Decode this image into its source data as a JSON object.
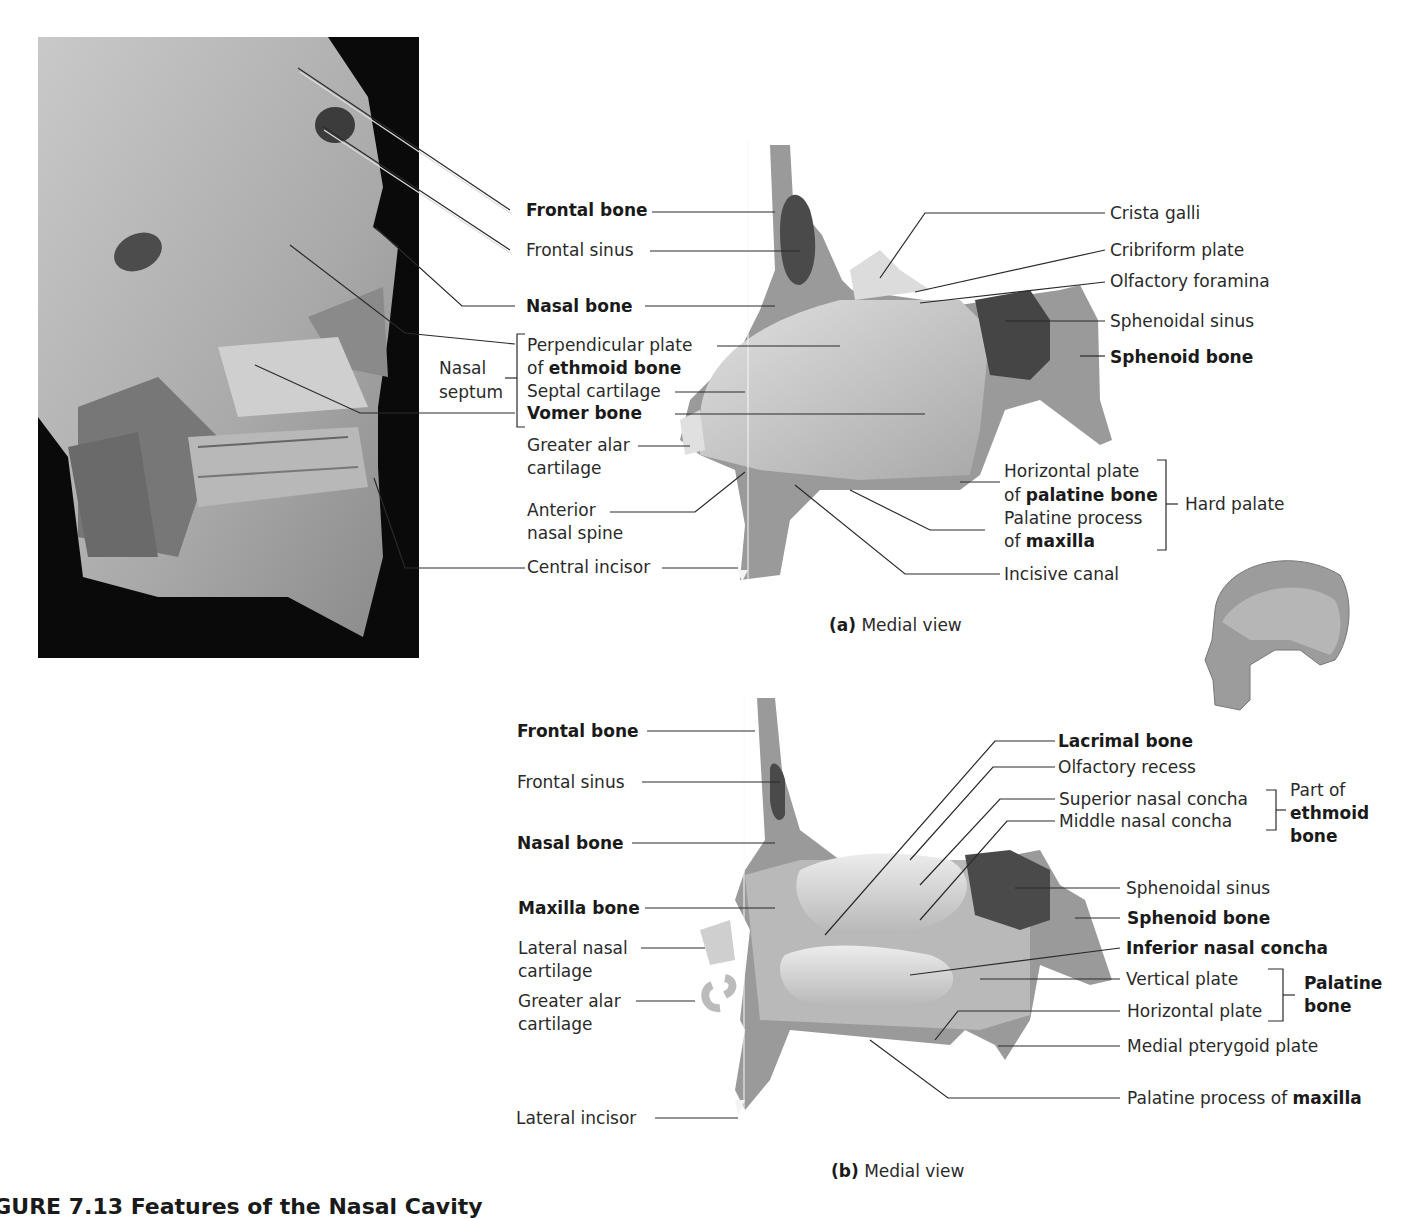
{
  "figure": {
    "title": "FIGURE 7.13 Features of the Nasal Cavity",
    "panels": [
      {
        "id": "a",
        "caption_letter": "(a)",
        "caption_text": "Medial view"
      },
      {
        "id": "b",
        "caption_letter": "(b)",
        "caption_text": "Medial view"
      }
    ]
  },
  "panel_a": {
    "left_labels": {
      "frontal_bone": "Frontal bone",
      "frontal_sinus": "Frontal sinus",
      "nasal_bone": "Nasal bone",
      "perp_plate_1": "Perpendicular plate",
      "perp_plate_2_pre": "of ",
      "perp_plate_2_bold": "ethmoid bone",
      "nasal_septum_1": "Nasal",
      "nasal_septum_2": "septum",
      "septal_cartilage": "Septal cartilage",
      "vomer_bone": "Vomer bone",
      "greater_alar_1": "Greater alar",
      "greater_alar_2": "cartilage",
      "anterior_spine_1": "Anterior",
      "anterior_spine_2": "nasal spine",
      "central_incisor": "Central incisor"
    },
    "right_labels": {
      "crista_galli": "Crista galli",
      "cribriform_plate": "Cribriform plate",
      "olfactory_foramina": "Olfactory foramina",
      "sphenoidal_sinus": "Sphenoidal sinus",
      "sphenoid_bone": "Sphenoid bone",
      "horizontal_plate_1": "Horizontal plate",
      "horizontal_plate_2_pre": "of ",
      "horizontal_plate_2_bold": "palatine bone",
      "palatine_process_1": "Palatine process",
      "palatine_process_2_pre": "of ",
      "palatine_process_2_bold": "maxilla",
      "hard_palate": "Hard palate",
      "incisive_canal": "Incisive canal"
    }
  },
  "panel_b": {
    "left_labels": {
      "frontal_bone": "Frontal bone",
      "frontal_sinus": "Frontal sinus",
      "nasal_bone": "Nasal bone",
      "maxilla_bone": "Maxilla bone",
      "lateral_nasal_1": "Lateral nasal",
      "lateral_nasal_2": "cartilage",
      "greater_alar_1": "Greater alar",
      "greater_alar_2": "cartilage",
      "lateral_incisor": "Lateral incisor"
    },
    "right_labels": {
      "lacrimal_bone": "Lacrimal bone",
      "olfactory_recess": "Olfactory recess",
      "superior_concha": "Superior nasal concha",
      "middle_concha": "Middle nasal concha",
      "part_of_1": "Part of",
      "part_of_2": "ethmoid",
      "part_of_3": "bone",
      "sphenoidal_sinus": "Sphenoidal sinus",
      "sphenoid_bone": "Sphenoid bone",
      "inferior_concha": "Inferior nasal concha",
      "vertical_plate": "Vertical plate",
      "horizontal_plate": "Horizontal plate",
      "palatine_1": "Palatine",
      "palatine_2": "bone",
      "medial_pterygoid": "Medial pterygoid plate",
      "palatine_process_pre": "Palatine process of ",
      "palatine_process_bold": "maxilla"
    }
  },
  "colors": {
    "bone_fill": "#8f8f8f",
    "bone_dark": "#5a5a5a",
    "sinus": "#4a4a4a",
    "cartilage": "#cfcfcf",
    "septum": "#bdbdbd",
    "photo_bg": "#0a0a0a",
    "leader_line": "#2a2a2a"
  }
}
